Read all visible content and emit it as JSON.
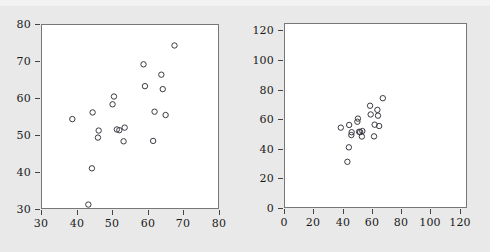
{
  "figure": {
    "background_color": "#e9e9e9",
    "panel_background_color": "#ffffff",
    "frame_color": "#777777",
    "marker_color": "#3a3a42",
    "marker_shape": "open-circle"
  },
  "chart_data": [
    {
      "type": "scatter",
      "panel": "left",
      "title": "",
      "xlabel": "",
      "ylabel": "",
      "xlim": [
        30,
        80
      ],
      "ylim": [
        30,
        80
      ],
      "xticks": [
        30,
        40,
        50,
        60,
        70,
        80
      ],
      "yticks": [
        30,
        40,
        50,
        60,
        70,
        80
      ],
      "xticklabels": [
        "30",
        "40",
        "50",
        "60",
        "70",
        "80"
      ],
      "yticklabels": [
        "30",
        "40",
        "50",
        "60",
        "70",
        "80"
      ],
      "grid": false,
      "legend": false,
      "marker": "o",
      "x": [
        38.8,
        43.3,
        44.3,
        44.5,
        46.0,
        46.2,
        50.1,
        50.5,
        51.3,
        52.0,
        53.2,
        53.5,
        58.8,
        59.2,
        61.5,
        61.9,
        63.8,
        64.2,
        65.0,
        67.5
      ],
      "y": [
        54.3,
        31.2,
        41.0,
        56.1,
        49.3,
        51.2,
        58.3,
        60.4,
        51.5,
        51.3,
        48.3,
        52.0,
        69.1,
        63.2,
        48.4,
        56.3,
        66.3,
        62.4,
        55.4,
        74.2
      ]
    },
    {
      "type": "scatter",
      "panel": "right",
      "title": "",
      "xlabel": "",
      "ylabel": "",
      "xlim": [
        0,
        125
      ],
      "ylim": [
        0,
        125
      ],
      "xticks": [
        0,
        20,
        40,
        60,
        80,
        100,
        120
      ],
      "yticks": [
        0,
        20,
        40,
        60,
        80,
        100,
        120
      ],
      "xticklabels": [
        "0",
        "20",
        "40",
        "60",
        "80",
        "100",
        "120"
      ],
      "yticklabels": [
        "0",
        "20",
        "40",
        "60",
        "80",
        "100",
        "120"
      ],
      "grid": false,
      "legend": false,
      "marker": "o",
      "x": [
        38.8,
        43.3,
        44.3,
        44.5,
        46.0,
        46.2,
        50.1,
        50.5,
        51.3,
        52.0,
        53.2,
        53.5,
        58.8,
        59.2,
        61.5,
        61.9,
        63.8,
        64.2,
        65.0,
        67.5
      ],
      "y": [
        54.3,
        31.2,
        41.0,
        56.1,
        49.3,
        51.2,
        58.3,
        60.4,
        51.5,
        51.3,
        48.3,
        52.0,
        69.1,
        63.2,
        48.4,
        56.3,
        66.3,
        62.4,
        55.4,
        74.2
      ]
    }
  ],
  "panels": [
    {
      "name": "left-panel",
      "frame": {
        "left": 41,
        "top": 24,
        "width": 178,
        "height": 185
      }
    },
    {
      "name": "right-panel",
      "frame": {
        "left": 39,
        "top": 23,
        "width": 183,
        "height": 185
      }
    }
  ]
}
